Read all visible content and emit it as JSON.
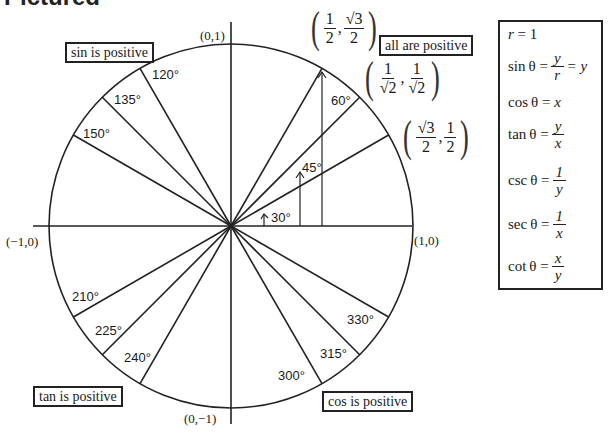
{
  "page_title": "Pictured",
  "diagram": {
    "quadrant_labels": {
      "q1": "all are positive",
      "q2": "sin is positive",
      "q3": "tan is positive",
      "q4": "cos is positive"
    },
    "axis_points": {
      "top": "(0,1)",
      "bottom": "(0,−1)",
      "left": "(−1,0)",
      "right": "(1,0)"
    },
    "angles": [
      {
        "deg": 30,
        "label": "30°"
      },
      {
        "deg": 45,
        "label": "45°"
      },
      {
        "deg": 60,
        "label": "60°"
      },
      {
        "deg": 120,
        "label": "120°"
      },
      {
        "deg": 135,
        "label": "135°"
      },
      {
        "deg": 150,
        "label": "150°"
      },
      {
        "deg": 210,
        "label": "210°"
      },
      {
        "deg": 225,
        "label": "225°"
      },
      {
        "deg": 240,
        "label": "240°"
      },
      {
        "deg": 300,
        "label": "300°"
      },
      {
        "deg": 315,
        "label": "315°"
      },
      {
        "deg": 330,
        "label": "330°"
      }
    ],
    "coordinates": {
      "p60": {
        "x_num": "1",
        "x_den": "2",
        "y_num": "√3",
        "y_den": "2"
      },
      "p45": {
        "x_num": "1",
        "x_den": "√2",
        "y_num": "1",
        "y_den": "√2"
      },
      "p30": {
        "x_num": "√3",
        "x_den": "2",
        "y_num": "1",
        "y_den": "2"
      }
    },
    "colors": {
      "line": "#222222",
      "background": "#ffffff"
    }
  },
  "formulas": {
    "r": {
      "lhs": "r",
      "rhs": "= 1"
    },
    "sin": {
      "lhs": "sin θ =",
      "num": "y",
      "den": "r",
      "tail": "= y"
    },
    "cos": {
      "lhs": "cos θ =",
      "rhs": "x"
    },
    "tan": {
      "lhs": "tan θ =",
      "num": "y",
      "den": "x"
    },
    "csc": {
      "lhs": "csc θ =",
      "num": "1",
      "den": "y"
    },
    "sec": {
      "lhs": "sec θ =",
      "num": "1",
      "den": "x"
    },
    "cot": {
      "lhs": "cot θ =",
      "num": "x",
      "den": "y"
    }
  }
}
